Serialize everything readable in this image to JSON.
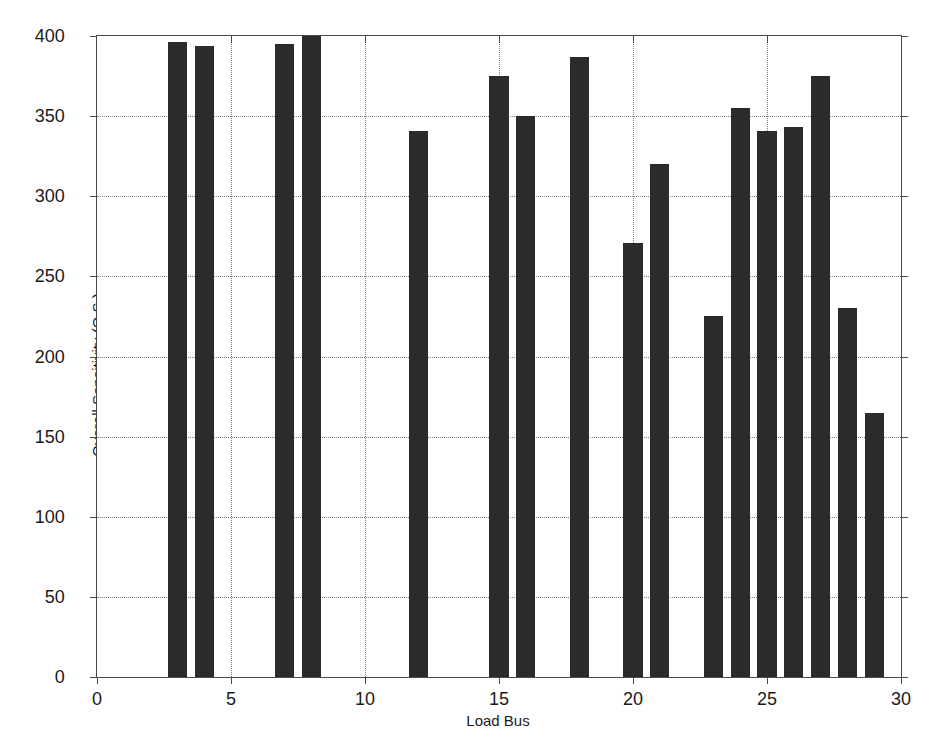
{
  "chart_data": {
    "type": "bar",
    "title": "",
    "xlabel": "Load Bus",
    "ylabel": "Overall Sensitivity (O.S.)",
    "xlim": [
      0,
      30
    ],
    "ylim": [
      0,
      400
    ],
    "xticks": [
      0,
      5,
      10,
      15,
      20,
      25,
      30
    ],
    "yticks": [
      0,
      50,
      100,
      150,
      200,
      250,
      300,
      350,
      400
    ],
    "grid": true,
    "legend": null,
    "bar_color": "#2b2b2b",
    "categories": [
      3,
      4,
      7,
      8,
      12,
      15,
      16,
      18,
      20,
      21,
      23,
      24,
      25,
      26,
      27,
      28,
      29
    ],
    "values": [
      396,
      394,
      395,
      400,
      341,
      375,
      350,
      387,
      271,
      320,
      225,
      355,
      341,
      343,
      375,
      230,
      165
    ],
    "bars": [
      {
        "x": 3,
        "value": 396
      },
      {
        "x": 4,
        "value": 394
      },
      {
        "x": 7,
        "value": 395
      },
      {
        "x": 8,
        "value": 400
      },
      {
        "x": 12,
        "value": 341
      },
      {
        "x": 15,
        "value": 375
      },
      {
        "x": 16,
        "value": 350
      },
      {
        "x": 18,
        "value": 387
      },
      {
        "x": 20,
        "value": 271
      },
      {
        "x": 21,
        "value": 320
      },
      {
        "x": 23,
        "value": 225
      },
      {
        "x": 24,
        "value": 355
      },
      {
        "x": 25,
        "value": 341
      },
      {
        "x": 26,
        "value": 343
      },
      {
        "x": 27,
        "value": 375
      },
      {
        "x": 28,
        "value": 230
      },
      {
        "x": 29,
        "value": 165
      }
    ]
  },
  "axes": {
    "x_tick_labels": [
      "0",
      "5",
      "10",
      "15",
      "20",
      "25",
      "30"
    ],
    "y_tick_labels": [
      "0",
      "50",
      "100",
      "150",
      "200",
      "250",
      "300",
      "350",
      "400"
    ],
    "x_title": "Load Bus",
    "y_title": "Overall Sensitivity (O.S.)"
  }
}
